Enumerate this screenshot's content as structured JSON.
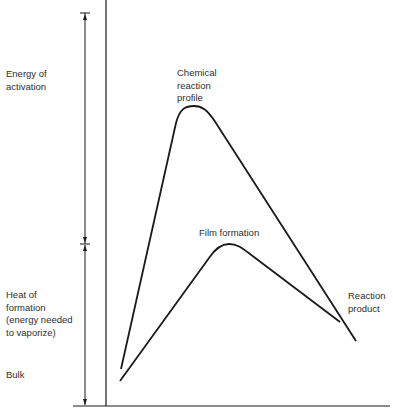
{
  "diagram": {
    "type": "energy-profile",
    "left_labels": {
      "energy_of_activation": "Energy of\nactivation",
      "heat_of_formation": "Heat of\nformation\n(energy needed\nto vaporize)",
      "bulk": "Bulk"
    },
    "curve_labels": {
      "chemical_reaction_profile": "Chemical\nreaction\nprofile",
      "film_formation": "Film formation",
      "reaction_product": "Reaction\nproduct"
    },
    "curves": [
      {
        "name": "Chemical reaction profile",
        "start": [
          121,
          369
        ],
        "peak": [
          194,
          106
        ],
        "end": [
          356,
          341
        ]
      },
      {
        "name": "Film formation",
        "start": [
          120,
          381
        ],
        "peak": [
          228,
          244
        ],
        "end": [
          340,
          322
        ]
      }
    ],
    "colors": {
      "line": "#1a1a1a",
      "text": "#2e2e2e",
      "background": "#ffffff"
    }
  }
}
